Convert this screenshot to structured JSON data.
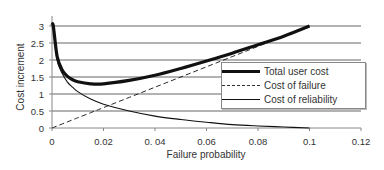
{
  "chart_data": {
    "type": "line",
    "title": "",
    "xlabel": "Failure probability",
    "ylabel": "Cost increment",
    "xlim": [
      0,
      0.12
    ],
    "ylim": [
      0,
      3
    ],
    "x_ticks": [
      "0",
      "0.02",
      "0. 04",
      "0.06",
      "0.08",
      "0.1",
      "0.12"
    ],
    "y_ticks": [
      "0",
      "0.5",
      "1",
      "1.5",
      "2",
      "2.5",
      "3"
    ],
    "grid": "horizontal",
    "legend_position": "right-center",
    "x": [
      0.0005,
      0.002,
      0.004,
      0.006,
      0.008,
      0.01,
      0.015,
      0.02,
      0.03,
      0.04,
      0.05,
      0.06,
      0.07,
      0.08,
      0.09,
      0.1
    ],
    "series": [
      {
        "name": "Total user cost",
        "style": "thick-solid",
        "values": [
          3.0,
          2.1,
          1.7,
          1.52,
          1.42,
          1.36,
          1.3,
          1.3,
          1.4,
          1.55,
          1.75,
          1.97,
          2.2,
          2.45,
          2.7,
          3.0
        ]
      },
      {
        "name": "Cost of failure",
        "style": "dashed",
        "values": [
          0.015,
          0.06,
          0.12,
          0.18,
          0.24,
          0.3,
          0.45,
          0.6,
          0.9,
          1.2,
          1.5,
          1.8,
          2.1,
          2.4,
          2.7,
          3.0
        ]
      },
      {
        "name": "Cost of reliability",
        "style": "thin-solid",
        "values": [
          3.0,
          2.0,
          1.6,
          1.35,
          1.2,
          1.07,
          0.85,
          0.7,
          0.5,
          0.35,
          0.25,
          0.17,
          0.1,
          0.06,
          0.03,
          0.0
        ]
      }
    ]
  },
  "axes": {
    "xlabel": "Failure probability",
    "ylabel": "Cost increment"
  },
  "legend": {
    "items": [
      {
        "label": "Total user cost"
      },
      {
        "label": "Cost of failure"
      },
      {
        "label": "Cost of reliability"
      }
    ]
  },
  "colors": {
    "line": "#111111",
    "grid": "#555555",
    "axis": "#888888"
  }
}
